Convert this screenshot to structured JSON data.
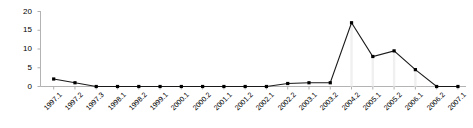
{
  "chart_data": {
    "type": "line",
    "title": "",
    "subtitle": "",
    "xlabel": "",
    "ylabel": "",
    "categories": [
      "1997.1",
      "1997.2",
      "1997.3",
      "1998.1",
      "1998.2",
      "1999.1",
      "2000.1",
      "2000.2",
      "2001.1",
      "2001.2",
      "2002.1",
      "2002.2",
      "2003.1",
      "2003.2",
      "2004.2",
      "2005.1",
      "2005.2",
      "2006.1",
      "2006.2",
      "2007.1"
    ],
    "values": [
      2,
      1,
      0,
      0,
      0,
      0,
      0,
      0,
      0,
      0,
      0,
      0.8,
      1,
      1,
      17,
      8,
      9.5,
      4.5,
      0,
      0
    ],
    "series": [
      {
        "name": "series-1",
        "values": [
          2,
          1,
          0,
          0,
          0,
          0,
          0,
          0,
          0,
          0,
          0,
          0.8,
          1,
          1,
          17,
          8,
          9.5,
          4.5,
          0,
          0
        ]
      }
    ],
    "ylim": [
      0,
      20
    ],
    "yticks": [
      0,
      5,
      10,
      15,
      20
    ],
    "ytick_labels": [
      "0",
      "5",
      "10",
      "15",
      "20"
    ],
    "grid": false,
    "legend": null,
    "legend_position": "none",
    "marker": "square",
    "line_color": "#000000",
    "marker_color": "#000000",
    "axis_color": "#b0b0b0"
  },
  "colors": {
    "background": "#ffffff",
    "line": "#1a1a1a",
    "marker": "#000000",
    "axis": "#b3b3b3",
    "tick": "#b3b3b3",
    "text": "#000000"
  }
}
